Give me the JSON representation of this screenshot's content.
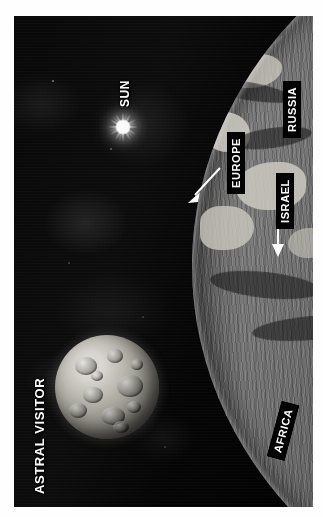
{
  "image": {
    "orientation": "rotated-90-ccw",
    "medium": "grayscale photo illustration",
    "background_color": "#ffffff"
  },
  "scene": {
    "space_color": "#101010",
    "earth_color": "#737373",
    "label_box_color": "#0a0a0a",
    "label_text_color": "#ffffff",
    "arrow_color": "#ffffff"
  },
  "labels": [
    {
      "id": "astral-visitor",
      "text": "ASTRAL VISITOR",
      "style": "plain",
      "rotation": -90,
      "arrow": false
    },
    {
      "id": "sun",
      "text": "SUN",
      "style": "plain",
      "rotation": -90,
      "arrow": false
    },
    {
      "id": "russia",
      "text": "RUSSIA",
      "style": "boxed",
      "rotation": -90,
      "arrow": false
    },
    {
      "id": "europe",
      "text": "EUROPE",
      "style": "boxed",
      "rotation": -90,
      "arrow": true,
      "arrow_direction": "down-left"
    },
    {
      "id": "israel",
      "text": "ISRAEL",
      "style": "boxed",
      "rotation": -90,
      "arrow": true,
      "arrow_direction": "down"
    },
    {
      "id": "africa",
      "text": "AFRICA",
      "style": "boxed",
      "rotation": -75,
      "arrow": false
    }
  ],
  "objects": {
    "sun": {
      "name": "SUN",
      "kind": "star",
      "rendered": "white starburst"
    },
    "visitor": {
      "name": "ASTRAL VISITOR",
      "kind": "cratered body",
      "rendered": "grey cratered sphere"
    },
    "earth": {
      "name": "Earth limb",
      "kind": "planet surface",
      "rendered": "curved textured limb at right"
    }
  }
}
